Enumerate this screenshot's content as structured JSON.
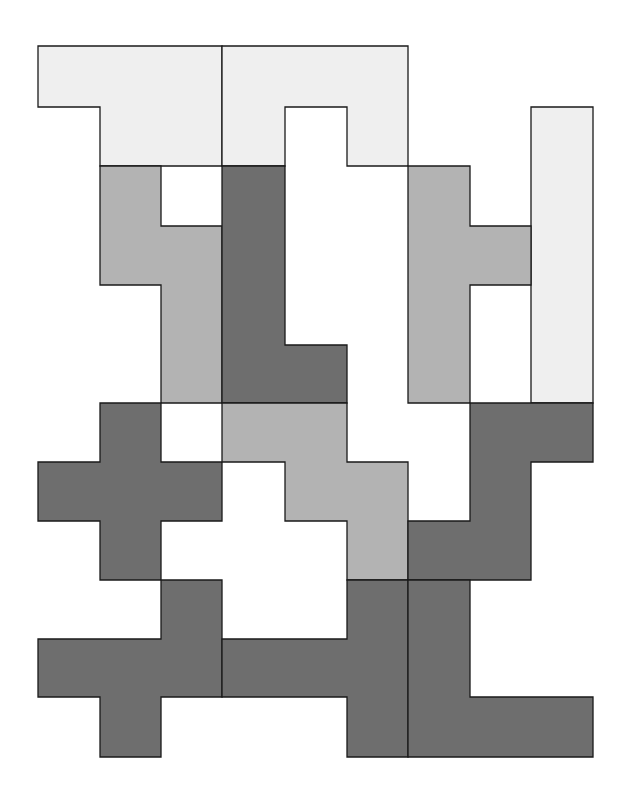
{
  "diagram": {
    "type": "polyomino-tiling",
    "colors": {
      "light": "#efefef",
      "mid": "#b3b3b3",
      "dark": "#6e6e6e",
      "background": "#ffffff",
      "stroke": "#1a1a1a"
    },
    "pieces": [
      {
        "id": "p1",
        "shade": "light",
        "points": "38,46 222,46 222,166 100,166 100,107 38,107"
      },
      {
        "id": "p2",
        "shade": "light",
        "points": "222,46 408,46 408,166 347,166 347,107 285,107 285,166 222,166"
      },
      {
        "id": "p3",
        "shade": "light",
        "points": "531,107 593,107 593,403 531,403"
      },
      {
        "id": "p4",
        "shade": "mid",
        "points": "100,166 161,166 161,226 222,226 222,403 161,403 161,285 100,285"
      },
      {
        "id": "p5",
        "shade": "dark",
        "points": "222,166 285,166 285,345 347,345 347,403 222,403"
      },
      {
        "id": "p6",
        "shade": "mid",
        "points": "408,166 470,166 470,226 531,226 531,285 470,285 470,403 408,403"
      },
      {
        "id": "p7",
        "shade": "dark",
        "points": "100,403 161,403 161,462 222,462 222,521 161,521 161,580 100,580 100,521 38,521 38,462 100,462"
      },
      {
        "id": "p8",
        "shade": "mid",
        "points": "222,403 347,403 347,462 408,462 408,580 347,580 347,521 285,521 285,462 222,462"
      },
      {
        "id": "p9",
        "shade": "dark",
        "points": "470,403 593,403 593,462 531,462 531,580 408,580 408,521 470,521"
      },
      {
        "id": "p10",
        "shade": "dark",
        "points": "161,580 222,580 222,697 161,697 161,757 100,757 100,697 38,697 38,639 161,639"
      },
      {
        "id": "p11",
        "shade": "dark",
        "points": "347,580 408,580 408,757 347,757 347,697 222,697 222,639 347,639"
      },
      {
        "id": "p12",
        "shade": "dark",
        "points": "408,580 470,580 470,697 593,697 593,757 408,757"
      }
    ]
  }
}
